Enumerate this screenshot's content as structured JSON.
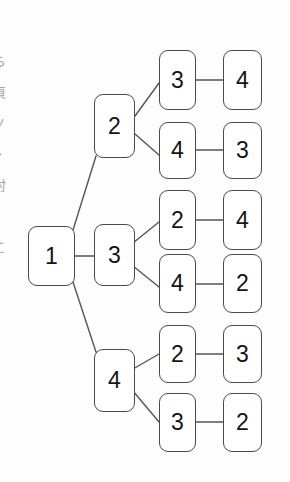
{
  "figure": {
    "kind": "tree-diagram",
    "background_color": "#fdfdfd",
    "node_fill": "#ffffff",
    "node_border_color": "#4a4a4a",
    "edge_color": "#555555",
    "text_color": "#141414"
  },
  "margin": {
    "glyphs": [
      "ら",
      "頁",
      "ノ",
      "・",
      "村",
      "。",
      "こ"
    ]
  },
  "nodes": [
    {
      "id": "root",
      "label": "1",
      "x": 28,
      "y": 226,
      "w": 47,
      "h": 60
    },
    {
      "id": "l2a",
      "label": "2",
      "x": 94,
      "y": 94,
      "w": 41,
      "h": 64
    },
    {
      "id": "l2b",
      "label": "3",
      "x": 94,
      "y": 224,
      "w": 41,
      "h": 62
    },
    {
      "id": "l2c",
      "label": "4",
      "x": 94,
      "y": 349,
      "w": 41,
      "h": 63
    },
    {
      "id": "l3r1",
      "label": "3",
      "x": 159,
      "y": 50,
      "w": 37,
      "h": 60
    },
    {
      "id": "l3r2",
      "label": "4",
      "x": 159,
      "y": 122,
      "w": 37,
      "h": 57
    },
    {
      "id": "l3r3",
      "label": "2",
      "x": 159,
      "y": 190,
      "w": 37,
      "h": 60
    },
    {
      "id": "l3r4",
      "label": "4",
      "x": 159,
      "y": 254,
      "w": 37,
      "h": 59
    },
    {
      "id": "l3r5",
      "label": "2",
      "x": 159,
      "y": 325,
      "w": 37,
      "h": 58
    },
    {
      "id": "l3r6",
      "label": "3",
      "x": 159,
      "y": 393,
      "w": 37,
      "h": 59
    },
    {
      "id": "l4r1",
      "label": "4",
      "x": 223,
      "y": 50,
      "w": 39,
      "h": 60
    },
    {
      "id": "l4r2",
      "label": "3",
      "x": 223,
      "y": 122,
      "w": 39,
      "h": 57
    },
    {
      "id": "l4r3",
      "label": "4",
      "x": 223,
      "y": 190,
      "w": 39,
      "h": 60
    },
    {
      "id": "l4r4",
      "label": "2",
      "x": 223,
      "y": 254,
      "w": 39,
      "h": 59
    },
    {
      "id": "l4r5",
      "label": "3",
      "x": 223,
      "y": 325,
      "w": 39,
      "h": 58
    },
    {
      "id": "l4r6",
      "label": "2",
      "x": 223,
      "y": 393,
      "w": 39,
      "h": 59
    }
  ],
  "edges": [
    {
      "from": "root",
      "to": "l2a",
      "x1": 73,
      "y1": 230,
      "x2": 96,
      "y2": 156,
      "kind": "diagonal"
    },
    {
      "from": "root",
      "to": "l2b",
      "x1": 75,
      "y1": 256,
      "x2": 94,
      "y2": 256,
      "kind": "horizontal"
    },
    {
      "from": "root",
      "to": "l2c",
      "x1": 73,
      "y1": 282,
      "x2": 96,
      "y2": 352,
      "kind": "diagonal"
    },
    {
      "from": "l2a",
      "to": "l3r1",
      "x1": 135,
      "y1": 116,
      "x2": 159,
      "y2": 83,
      "kind": "diagonal"
    },
    {
      "from": "l2a",
      "to": "l3r2",
      "x1": 135,
      "y1": 134,
      "x2": 159,
      "y2": 155,
      "kind": "diagonal"
    },
    {
      "from": "l2b",
      "to": "l3r3",
      "x1": 133,
      "y1": 243,
      "x2": 159,
      "y2": 222,
      "kind": "diagonal"
    },
    {
      "from": "l2b",
      "to": "l3r4",
      "x1": 133,
      "y1": 266,
      "x2": 159,
      "y2": 287,
      "kind": "diagonal"
    },
    {
      "from": "l2c",
      "to": "l3r5",
      "x1": 133,
      "y1": 369,
      "x2": 159,
      "y2": 354,
      "kind": "diagonal"
    },
    {
      "from": "l2c",
      "to": "l3r6",
      "x1": 133,
      "y1": 391,
      "x2": 159,
      "y2": 422,
      "kind": "diagonal"
    },
    {
      "from": "l3r1",
      "to": "l4r1",
      "x1": 196,
      "y1": 80,
      "x2": 223,
      "y2": 80,
      "kind": "horizontal"
    },
    {
      "from": "l3r2",
      "to": "l4r2",
      "x1": 196,
      "y1": 150,
      "x2": 223,
      "y2": 150,
      "kind": "horizontal"
    },
    {
      "from": "l3r3",
      "to": "l4r3",
      "x1": 196,
      "y1": 220,
      "x2": 223,
      "y2": 220,
      "kind": "horizontal"
    },
    {
      "from": "l3r4",
      "to": "l4r4",
      "x1": 196,
      "y1": 284,
      "x2": 223,
      "y2": 284,
      "kind": "horizontal"
    },
    {
      "from": "l3r5",
      "to": "l4r5",
      "x1": 196,
      "y1": 354,
      "x2": 223,
      "y2": 354,
      "kind": "horizontal"
    },
    {
      "from": "l3r6",
      "to": "l4r6",
      "x1": 196,
      "y1": 422,
      "x2": 223,
      "y2": 422,
      "kind": "horizontal"
    }
  ],
  "paths": [
    [
      "1",
      "2",
      "3",
      "4"
    ],
    [
      "1",
      "2",
      "4",
      "3"
    ],
    [
      "1",
      "3",
      "2",
      "4"
    ],
    [
      "1",
      "3",
      "4",
      "2"
    ],
    [
      "1",
      "4",
      "2",
      "3"
    ],
    [
      "1",
      "4",
      "3",
      "2"
    ]
  ]
}
